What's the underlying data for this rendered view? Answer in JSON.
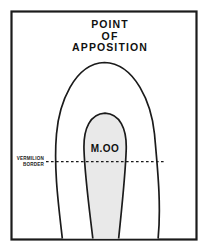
{
  "figure": {
    "name": "point-of-apposition-lip-diagram",
    "background_color": "#ffffff",
    "frame": {
      "stroke_color": "#1b1b1b",
      "fill_color": "#ffffff"
    },
    "title": {
      "line1": "POINT",
      "line2": "OF",
      "line3": "APPOSITION",
      "color": "#111111"
    },
    "outer_shape": {
      "label": "outer-lip-outline",
      "stroke_color": "#1b1b1b",
      "fill_color": "#ffffff"
    },
    "inner_shape": {
      "label": "M.OO",
      "stroke_color": "#1b1b1b",
      "fill_color": "#e9e9e9"
    },
    "vermilion_border": {
      "line1": "VERMILION",
      "line2": "BORDER",
      "line_color": "#1b1b1b",
      "line_style": "dashed"
    }
  }
}
